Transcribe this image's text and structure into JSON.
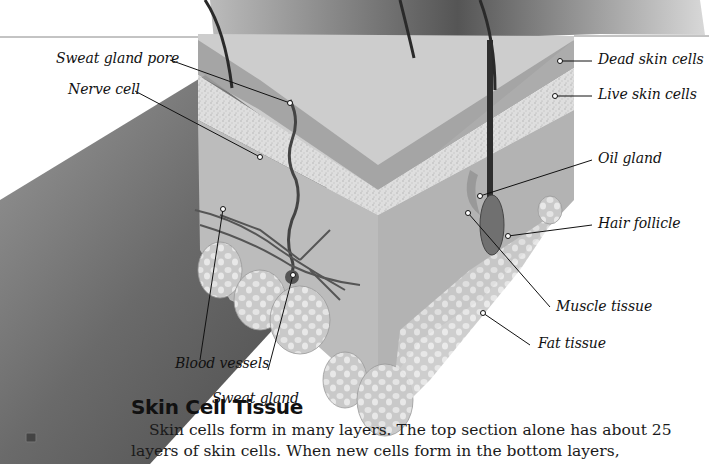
{
  "figure": {
    "labels": {
      "sweat_gland_pore": "Sweat gland pore",
      "nerve_cell": "Nerve cell",
      "dead_skin_cells": "Dead skin cells",
      "live_skin_cells": "Live skin cells",
      "oil_gland": "Oil gland",
      "hair_follicle": "Hair follicle",
      "muscle_tissue": "Muscle tissue",
      "fat_tissue": "Fat tissue",
      "blood_vessels": "Blood vessels",
      "sweat_gland": "Sweat gland"
    }
  },
  "section": {
    "heading": "Skin Cell Tissue",
    "paragraph": "Skin cells form in many layers. The top section alone has about 25 layers of skin cells. When new cells form in the bottom layers,"
  },
  "colors": {
    "arm_shadow": "#5a5a5a",
    "skin_top": "#cfcfcf",
    "dead_layer": "#9c9c9c",
    "live_layer": "#dcdcdc",
    "dermis": "#bdbdbd",
    "fat": "#d6d6d6",
    "text": "#111111"
  }
}
